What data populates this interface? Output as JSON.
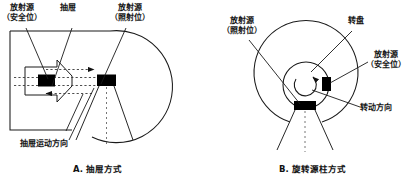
{
  "figure": {
    "title": "",
    "panels": [
      {
        "id": "A",
        "caption": "A. 抽屉方式",
        "labels": {
          "source_safe_l1": "放射源",
          "source_safe_l2": "（安全位）",
          "drawer": "抽屉",
          "source_irradiate_l1": "放射源",
          "source_irradiate_l2": "（照射位）",
          "drawer_motion": "抽屉运动方向"
        }
      },
      {
        "id": "B",
        "caption": "B. 旋转源柱方式",
        "labels": {
          "source_irradiate_l1": "放射源",
          "source_irradiate_l2": "（照射位）",
          "turntable": "转盘",
          "source_safe_l1": "放射源",
          "source_safe_l2": "（安全位）",
          "rotation_direction": "转动方向"
        }
      }
    ]
  },
  "colors": {
    "stroke": "#1a1a1a",
    "source_block": "#000000",
    "background": "#ffffff",
    "beam_dotted": "#555555"
  }
}
